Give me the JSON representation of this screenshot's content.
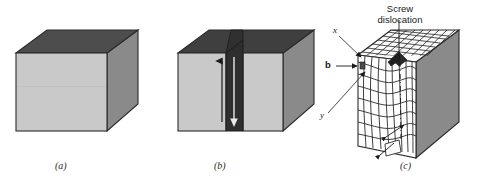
{
  "figure": {
    "background": "#ffffff",
    "panels": [
      {
        "id": "a",
        "caption": "(a)",
        "description": "perfect-crystal block",
        "colors": {
          "top": "#4d4d4d",
          "front": "#c9c9c9",
          "side": "#8a8a8a",
          "outline": "#2b2b2b"
        }
      },
      {
        "id": "b",
        "caption": "(b)",
        "description": "block sheared along cut plane",
        "colors": {
          "top": "#3f3f3f",
          "front": "#c9c9c9",
          "side": "#8a8a8a",
          "cut": "#2e2e2e",
          "outline": "#2b2b2b"
        },
        "arrows": [
          {
            "name": "shear-arrow-up",
            "direction": "up"
          },
          {
            "name": "shear-arrow-down",
            "direction": "down"
          }
        ]
      },
      {
        "id": "c",
        "caption": "(c)",
        "description": "atomic lattice showing screw dislocation",
        "colors": {
          "grid": "#1f1f1f",
          "face": "#ffffff",
          "side": "#8a8a8a",
          "top": "#f2f2f2",
          "outline": "#2b2b2b"
        },
        "annotations": [
          {
            "name": "screw-dislocation-label",
            "text": "Screw\ndislocation",
            "line1": "Screw",
            "line2": "dislocation"
          },
          {
            "name": "axis-label-x",
            "text": "x"
          },
          {
            "name": "axis-label-y",
            "text": "y"
          },
          {
            "name": "burgers-vector-label",
            "text": "b"
          }
        ]
      }
    ],
    "captions": {
      "a": "(a)",
      "b": "(b)",
      "c": "(c)"
    },
    "labels": {
      "screw_line1": "Screw",
      "screw_line2": "dislocation",
      "x": "x",
      "y": "y",
      "b": "b"
    }
  }
}
